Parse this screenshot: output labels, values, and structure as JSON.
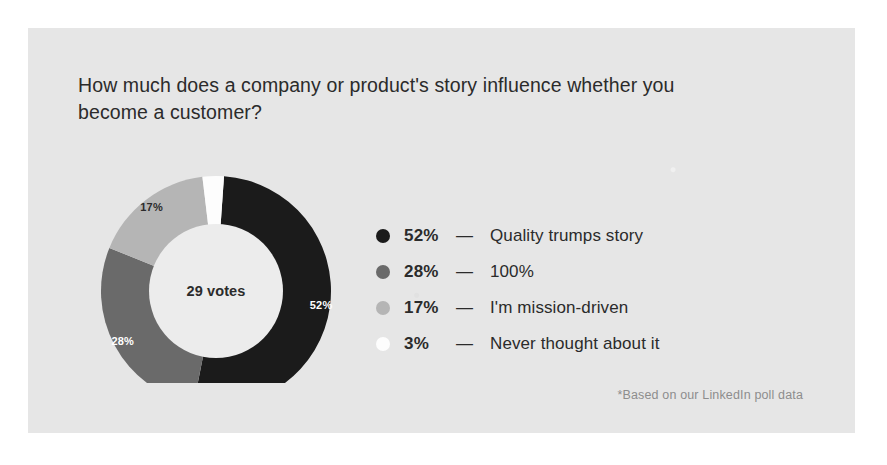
{
  "card": {
    "background_color": "#e6e6e6",
    "title": "How much does a company or product's story influence whether you become a customer?",
    "footnote": "*Based on our LinkedIn poll data"
  },
  "chart_data": {
    "type": "pie",
    "variant": "donut",
    "title": "How much does a company or product's story influence whether you become a customer?",
    "center_label": "29 votes",
    "total_votes": 29,
    "unit": "%",
    "legend_position": "right",
    "grid": false,
    "categories": [
      "Quality trumps story",
      "100%",
      "I'm mission-driven",
      "Never thought about it"
    ],
    "values": [
      52,
      28,
      17,
      3
    ],
    "value_labels": [
      "52%",
      "28%",
      "17%",
      "3%"
    ],
    "slice_colors": [
      "#1b1b1b",
      "#6a6a6a",
      "#b5b5b5",
      "#fdfdfd"
    ],
    "slice_label_colors": [
      "#ffffff",
      "#ffffff",
      "#2b2b2b",
      "#2b2b2b"
    ],
    "slices_with_visible_label": [
      "52%",
      "28%",
      "17%"
    ],
    "start_angle_deg": 4,
    "footnote": "*Based on our LinkedIn poll data"
  },
  "legend": {
    "separator": "—",
    "items": [
      {
        "pct": "52%",
        "label": "Quality trumps story",
        "color": "#1b1b1b"
      },
      {
        "pct": "28%",
        "label": "100%",
        "color": "#6a6a6a"
      },
      {
        "pct": "17%",
        "label": "I'm mission-driven",
        "color": "#b5b5b5"
      },
      {
        "pct": "3%",
        "label": "Never thought about it",
        "color": "#fdfdfd"
      }
    ]
  }
}
